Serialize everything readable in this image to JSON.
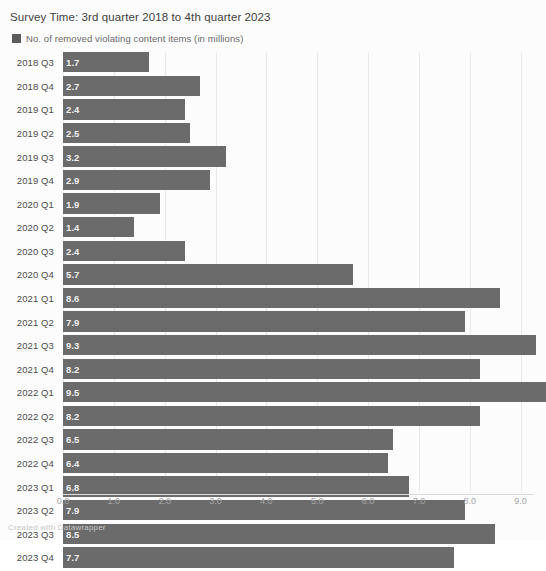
{
  "header": {
    "survey_time": "Survey Time: 3rd quarter 2018 to 4th quarter 2023"
  },
  "legend": {
    "swatch_color": "#5c5c5c",
    "label": "No. of removed violating content items (in millions)"
  },
  "footer": {
    "credit": "Created with Datawrapper"
  },
  "chart_data": {
    "type": "bar",
    "orientation": "horizontal",
    "title": "Survey Time: 3rd quarter 2018 to 4th quarter 2023",
    "xlabel": "",
    "ylabel": "",
    "series_name": "No. of removed violating content items (in millions)",
    "bar_color": "#6b6b6b",
    "grid": true,
    "legend_position": "top-left",
    "xlim": [
      0,
      9.5
    ],
    "xticks": [
      "0.0",
      "1.0",
      "2.0",
      "3.0",
      "4.0",
      "5.0",
      "6.0",
      "7.0",
      "8.0",
      "9.0"
    ],
    "xtick_values": [
      0,
      1,
      2,
      3,
      4,
      5,
      6,
      7,
      8,
      9
    ],
    "categories": [
      "2018 Q3",
      "2018 Q4",
      "2019 Q1",
      "2019 Q2",
      "2019 Q3",
      "2019 Q4",
      "2020 Q1",
      "2020 Q2",
      "2020 Q3",
      "2020 Q4",
      "2021 Q1",
      "2021 Q2",
      "2021 Q3",
      "2021 Q4",
      "2022 Q1",
      "2022 Q2",
      "2022 Q3",
      "2022 Q4",
      "2023 Q1",
      "2023 Q2",
      "2023 Q3",
      "2023 Q4"
    ],
    "values": [
      1.7,
      2.7,
      2.4,
      2.5,
      3.2,
      2.9,
      1.9,
      1.4,
      2.4,
      5.7,
      8.6,
      7.9,
      9.3,
      8.2,
      9.5,
      8.2,
      6.5,
      6.4,
      6.8,
      7.9,
      8.5,
      7.7
    ],
    "value_labels": [
      "1.7",
      "2.7",
      "2.4",
      "2.5",
      "3.2",
      "2.9",
      "1.9",
      "1.4",
      "2.4",
      "5.7",
      "8.6",
      "7.9",
      "9.3",
      "8.2",
      "9.5",
      "8.2",
      "6.5",
      "6.4",
      "6.8",
      "7.9",
      "8.5",
      "7.7"
    ]
  }
}
